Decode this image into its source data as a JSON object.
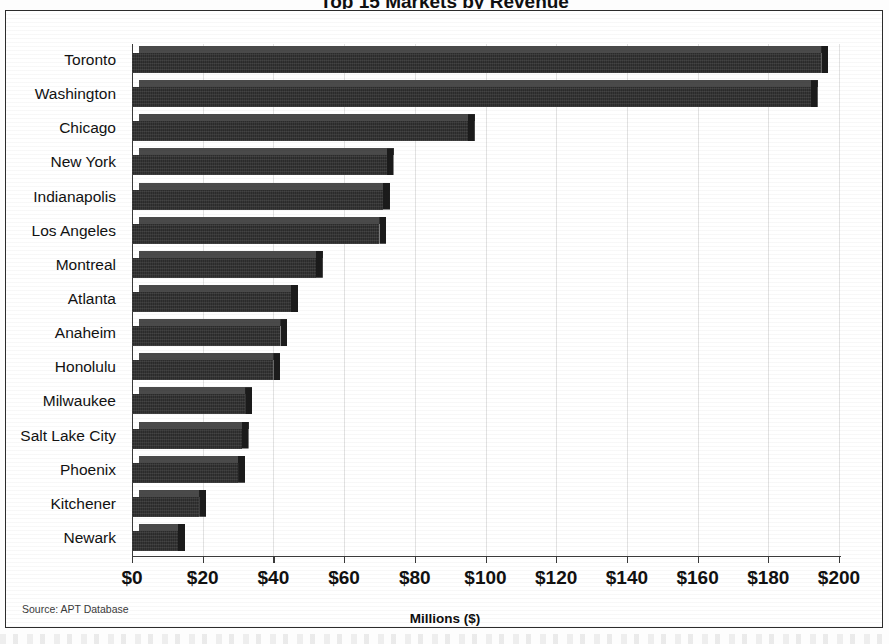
{
  "figure": {
    "partial_title": "Top 15 Markets by Revenue",
    "source_note": "Source: APT Database"
  },
  "chart_data": {
    "type": "bar",
    "orientation": "horizontal",
    "title": "",
    "xlabel": "Millions ($)",
    "ylabel": "",
    "xlim": [
      0,
      200
    ],
    "xticks": [
      0,
      20,
      40,
      60,
      80,
      100,
      120,
      140,
      160,
      180,
      200
    ],
    "xtick_labels": [
      "$0",
      "$20",
      "$40",
      "$60",
      "$80",
      "$100",
      "$120",
      "$140",
      "$160",
      "$180",
      "$200"
    ],
    "grid": true,
    "grid_axis": "x",
    "legend": false,
    "bar_color": "#2b2b2b",
    "bar_top_color": "#4a4a4a",
    "bar_side_color": "#1b1b1b",
    "grid_color": "#e2e2e2",
    "axis_color": "#3a3a3a",
    "categories": [
      "Toronto",
      "Washington",
      "Chicago",
      "New York",
      "Indianapolis",
      "Los Angeles",
      "Montreal",
      "Atlanta",
      "Anaheim",
      "Honolulu",
      "Milwaukee",
      "Salt Lake City",
      "Phoenix",
      "Kitchener",
      "Newark"
    ],
    "values": [
      195,
      192,
      95,
      72,
      71,
      70,
      52,
      45,
      42,
      40,
      32,
      31,
      30,
      19,
      13
    ],
    "units": "Millions ($)"
  }
}
